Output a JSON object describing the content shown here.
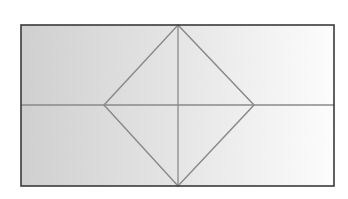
{
  "canvas": {
    "width": 348,
    "height": 199,
    "background": "#ffffff"
  },
  "figure": {
    "title": "Rectangle with inscribed diamond and median lines",
    "style": {
      "outer_border_color": "#3a3a3a",
      "outer_border_width": 1.6,
      "inner_line_color": "#8a8a8a",
      "inner_line_width": 1.5,
      "median_line_color": "#8a8a8a",
      "median_line_width": 1.3,
      "fill_gradient_start": "#d0d0d0",
      "fill_gradient_mid": "#e4e4e4",
      "fill_gradient_end": "#fefefe",
      "fill_gradient_direction": "horizontal-left-to-right",
      "texture_opacity": 0.05
    },
    "rectangle": {
      "name": "outer-rectangle",
      "x": 21,
      "y": 25,
      "width": 313,
      "height": 161,
      "corners": [
        {
          "label": "top-left",
          "x": 21,
          "y": 25
        },
        {
          "label": "top-right",
          "x": 334,
          "y": 25
        },
        {
          "label": "bottom-right",
          "x": 334,
          "y": 186
        },
        {
          "label": "bottom-left",
          "x": 21,
          "y": 186
        }
      ]
    },
    "diamond": {
      "name": "inscribed-diamond",
      "vertices": [
        {
          "label": "top",
          "x": 178,
          "y": 25
        },
        {
          "label": "right",
          "x": 254,
          "y": 105
        },
        {
          "label": "bottom",
          "x": 178,
          "y": 186
        },
        {
          "label": "left",
          "x": 104,
          "y": 105
        }
      ],
      "points_attr": "178,25 254,105 178,186 104,105"
    },
    "horizontal_median": {
      "name": "horizontal-median-line",
      "x1": 21,
      "y1": 105,
      "x2": 334,
      "y2": 105
    },
    "vertical_median": {
      "name": "vertical-median-line",
      "x1": 178,
      "y1": 25,
      "x2": 178,
      "y2": 186
    },
    "center_point": {
      "x": 178,
      "y": 105
    }
  }
}
